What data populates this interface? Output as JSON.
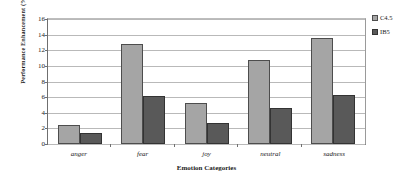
{
  "chart_data": {
    "type": "bar",
    "title": "",
    "xlabel": "Emotion Categories",
    "ylabel": "Performance Enhancement (%)",
    "categories": [
      "anger",
      "fear",
      "joy",
      "neutral",
      "sadness"
    ],
    "series": [
      {
        "name": "C4.5",
        "color": "#a5a5a5",
        "values": [
          2.4,
          12.8,
          5.3,
          10.8,
          13.6
        ]
      },
      {
        "name": "IB5",
        "color": "#595959",
        "values": [
          1.4,
          6.2,
          2.7,
          4.6,
          6.3
        ]
      }
    ],
    "ylim": [
      0,
      16
    ],
    "yticks": [
      0,
      2,
      4,
      6,
      8,
      10,
      12,
      14,
      16
    ],
    "ytick_labels": [
      "0",
      "2",
      "4",
      "6",
      "8",
      "10",
      "12",
      "14",
      "16"
    ],
    "grid": true,
    "legend_position": "right"
  }
}
